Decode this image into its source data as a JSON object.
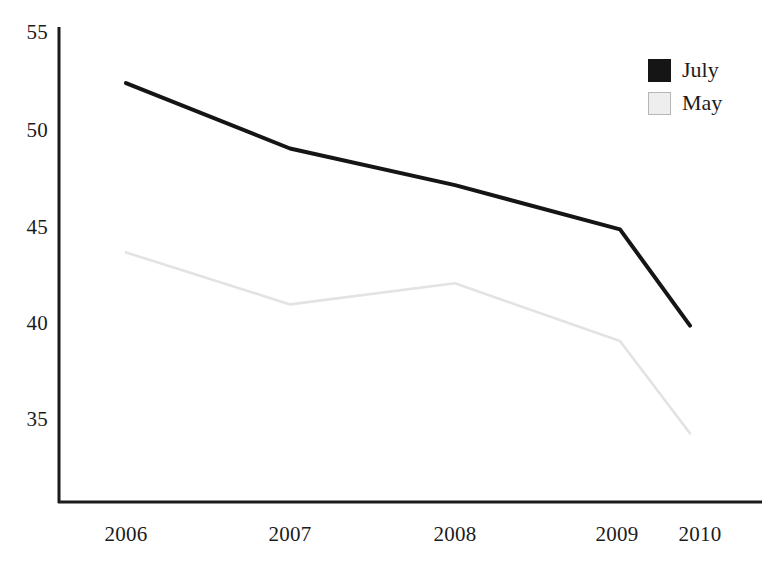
{
  "chart_data": {
    "type": "line",
    "title": "",
    "xlabel": "",
    "ylabel": "",
    "categories": [
      "2006",
      "2007",
      "2008",
      "2009",
      "2010"
    ],
    "x": [
      2006,
      2007,
      2008,
      2009,
      2010
    ],
    "series": [
      {
        "name": "July",
        "color": "#151515",
        "values": [
          52.4,
          49.0,
          47.1,
          44.8,
          39.8
        ]
      },
      {
        "name": "May",
        "color": "#e3e3e3",
        "values": [
          43.6,
          40.9,
          42.0,
          39.0,
          34.2
        ]
      }
    ],
    "ylim": [
      32.4,
      55.5
    ],
    "yticks": [
      35,
      40,
      45,
      50,
      55
    ],
    "ytick_labels": [
      "35",
      "40",
      "45",
      "50",
      "55"
    ],
    "xtick_labels": [
      "2006",
      "2007",
      "2008",
      "2009",
      "2010"
    ],
    "grid": false,
    "legend_position": "top-right",
    "legend": [
      {
        "label": "July",
        "swatch": "black-filled-square"
      },
      {
        "label": "May",
        "swatch": "light-gray-square"
      }
    ]
  },
  "axes": {
    "y_tick_0": "55",
    "y_tick_1": "50",
    "y_tick_2": "45",
    "y_tick_3": "40",
    "y_tick_4": "35",
    "x_tick_0": "2006",
    "x_tick_1": "2007",
    "x_tick_2": "2008",
    "x_tick_3": "2009",
    "x_tick_4": "2010"
  },
  "legend": {
    "july_label": "July",
    "may_label": "May"
  },
  "colors": {
    "july_line": "#151515",
    "may_line": "#e3e3e3",
    "axis": "#1b1b1b",
    "background": "#ffffff"
  }
}
